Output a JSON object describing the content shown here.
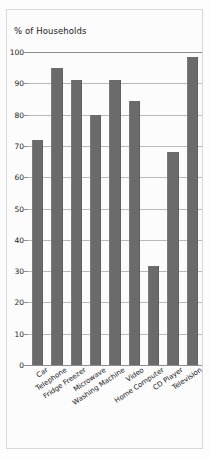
{
  "chart_data": {
    "type": "bar",
    "title": "% of Households",
    "xlabel": "",
    "ylabel": "% of Households",
    "categories": [
      "Car",
      "Telephone",
      "Fridge Freezer",
      "Microwave",
      "Washing Machine",
      "Video",
      "Home Computer",
      "CD Player",
      "Television"
    ],
    "values": [
      72,
      95,
      91,
      80,
      91,
      84.5,
      31.5,
      68,
      98.5
    ],
    "ylim": [
      0,
      100
    ],
    "ytick_labels": [
      "0",
      "10",
      "20",
      "30",
      "40",
      "50",
      "60",
      "70",
      "80",
      "90",
      "100"
    ],
    "ytick_values": [
      0,
      10,
      20,
      30,
      40,
      50,
      60,
      70,
      80,
      90,
      100
    ],
    "grid": true,
    "legend": false,
    "bar_color": "#6b6b6b",
    "grid_color": "#b9b9b9",
    "axis_color": "#8d8d8d",
    "background_color": "#fcfcfc",
    "label_rotation_deg": -34
  }
}
